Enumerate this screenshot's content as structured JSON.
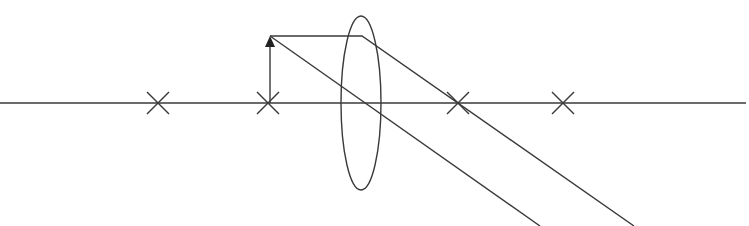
{
  "diagram": {
    "colors": {
      "line": "#3a3a3a",
      "arrowhead": "#222222",
      "background": "#ffffff"
    },
    "axis": {
      "x1": 0,
      "y": 103,
      "x2": 746
    },
    "focal_marks": [
      {
        "id": "2F-left",
        "x": 158
      },
      {
        "id": "F-left",
        "x": 268
      },
      {
        "id": "F-right",
        "x": 458
      },
      {
        "id": "2F-right",
        "x": 563
      }
    ],
    "lens": {
      "cx": 361,
      "cy": 103,
      "rx": 20,
      "ry": 87
    },
    "object": {
      "x": 270,
      "base_y": 103,
      "tip_y": 36
    },
    "rays": [
      {
        "id": "parallel-ray",
        "points": "270,36 362,36 634,226"
      },
      {
        "id": "center-ray",
        "points": "270,36 540,226"
      }
    ]
  }
}
